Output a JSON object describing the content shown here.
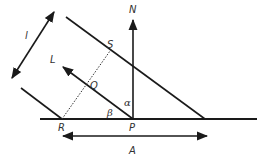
{
  "diagram": {
    "type": "geometry",
    "colors": {
      "stroke": "#1a1a1a",
      "label": "#333333",
      "background": "#ffffff"
    },
    "points": {
      "R": "R",
      "P": "P",
      "S": "S",
      "Q": "Q"
    },
    "arrows": {
      "normal": "N",
      "direction": "L",
      "width": "l",
      "span": "A"
    },
    "angles": {
      "alpha": "α",
      "beta": "β"
    }
  }
}
